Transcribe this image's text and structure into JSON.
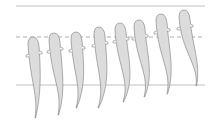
{
  "diagram": {
    "colors": {
      "body_fill": "#dcdcdc",
      "outline": "#7a7a7a",
      "line_solid": "#b0b0b0",
      "line_dashed": "#9a9a9a"
    },
    "reference_lines": [
      {
        "name": "top-line",
        "style": "solid",
        "y": 6
      },
      {
        "name": "mid-line",
        "style": "dashed",
        "y": 37
      },
      {
        "name": "bottom-line",
        "style": "solid",
        "y": 85
      }
    ],
    "frames": [
      {
        "index": 1,
        "head_x": 33,
        "head_y": 38,
        "tail_x": 35,
        "tail_y": 118,
        "bend": 6
      },
      {
        "index": 2,
        "head_x": 54,
        "head_y": 34,
        "tail_x": 58,
        "tail_y": 115,
        "bend": 8
      },
      {
        "index": 3,
        "head_x": 76,
        "head_y": 33,
        "tail_x": 76,
        "tail_y": 108,
        "bend": 10
      },
      {
        "index": 4,
        "head_x": 99,
        "head_y": 28,
        "tail_x": 98,
        "tail_y": 108,
        "bend": 12
      },
      {
        "index": 5,
        "head_x": 120,
        "head_y": 24,
        "tail_x": 123,
        "tail_y": 102,
        "bend": 12
      },
      {
        "index": 6,
        "head_x": 139,
        "head_y": 21,
        "tail_x": 144,
        "tail_y": 97,
        "bend": 10
      },
      {
        "index": 7,
        "head_x": 161,
        "head_y": 15,
        "tail_x": 167,
        "tail_y": 94,
        "bend": 8
      },
      {
        "index": 8,
        "head_x": 184,
        "head_y": 11,
        "tail_x": 196,
        "tail_y": 86,
        "bend": 5
      }
    ]
  }
}
